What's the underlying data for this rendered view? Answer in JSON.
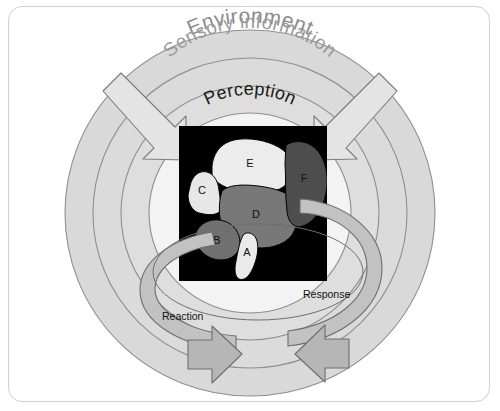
{
  "figure": {
    "title_visible": false,
    "frame": {
      "border_color": "#cfcfcf",
      "background_color": "#ffffff"
    }
  },
  "rings": [
    {
      "id": "environment",
      "label": "Environment",
      "label_color": "#8c8c8c",
      "fill": "#d9d9d9",
      "stroke": "#8f8f8f",
      "order": 1
    },
    {
      "id": "sensory-information",
      "label": "Sensory information",
      "label_color": "#8f8f8f",
      "fill": "#d9d9d9",
      "stroke": "#8f8f8f",
      "order": 2
    },
    {
      "id": "perception",
      "label": "Perception",
      "label_color": "#1a1a1a",
      "fill": "#dcdcdc",
      "stroke": "#8f8f8f",
      "order": 3
    }
  ],
  "inflow_arrows": [
    {
      "id": "inflow-left",
      "direction": "down-right",
      "fill": "#e2e2e2",
      "stroke": "#7d7d7d"
    },
    {
      "id": "inflow-right",
      "direction": "down-left",
      "fill": "#e2e2e2",
      "stroke": "#7d7d7d"
    }
  ],
  "cycle": {
    "band_fill": "#c2c2c2",
    "band_stroke": "#6e6e6e",
    "arrow_fill": "#b5b5b5",
    "labels": [
      {
        "id": "reaction",
        "text": "Reaction",
        "color": "#141414"
      },
      {
        "id": "response",
        "text": "Response",
        "color": "#141414"
      }
    ]
  },
  "brain_panel": {
    "background": "#000000",
    "caption_visible": false,
    "regions": [
      {
        "id": "region-a",
        "label": "A",
        "fill": "#e8e8e8",
        "description": "small pale elongated lobe, lower center"
      },
      {
        "id": "region-b",
        "label": "B",
        "fill": "#6e6e6e",
        "description": "medium dark-gray lobe, lower left"
      },
      {
        "id": "region-c",
        "label": "C",
        "fill": "#e6e6e6",
        "description": "pale lobe, mid left"
      },
      {
        "id": "region-d",
        "label": "D",
        "fill": "#767676",
        "description": "large mid-gray central lobe"
      },
      {
        "id": "region-e",
        "label": "E",
        "fill": "#ebebeb",
        "description": "large pale upper lobe"
      },
      {
        "id": "region-f",
        "label": "F",
        "fill": "#4a4a4a",
        "description": "large dark lobe, right side"
      }
    ]
  },
  "palette": {
    "ring_fill": "#d9d9d9",
    "ring_stroke": "#8f8f8f",
    "inner_fill": "#f2f2f2",
    "cycle_band": "#c2c2c2",
    "frame_border": "#cfcfcf",
    "panel_black": "#000000"
  }
}
